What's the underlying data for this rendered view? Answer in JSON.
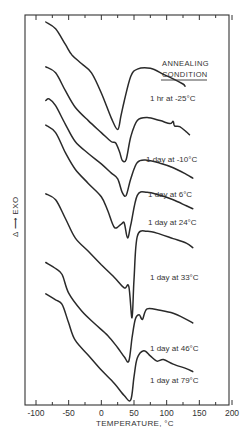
{
  "chart_data": {
    "type": "line",
    "title": "",
    "xlabel": "TEMPERATURE, °C",
    "ylabel": "Δ ⟶ EXO",
    "xlim": [
      -110,
      200
    ],
    "xticks": [
      -100,
      -50,
      0,
      50,
      100,
      150,
      200
    ],
    "xtick_labels": [
      "-100",
      "-50",
      "0",
      "50",
      "100",
      "150",
      "200"
    ],
    "grid": false,
    "legend_title": [
      "ANNEALING",
      "CONDITION"
    ],
    "legend_position": "right, beside each curve",
    "y_units": "arbitrary (curves vertically offset)",
    "series": [
      {
        "name": "1 hr at -25°C",
        "label": "1 hr at -25°C",
        "approx_min_temp": 25,
        "points": [
          [
            -85,
            0.0
          ],
          [
            -70,
            -0.9
          ],
          [
            -55,
            -3.0
          ],
          [
            -45,
            -4.4
          ],
          [
            -30,
            -5.6
          ],
          [
            -15,
            -6.8
          ],
          [
            0,
            -9.5
          ],
          [
            15,
            -12.8
          ],
          [
            25,
            -14.4
          ],
          [
            30,
            -12.6
          ],
          [
            35,
            -10.6
          ],
          [
            45,
            -7.3
          ],
          [
            55,
            -6.3
          ],
          [
            75,
            -6.2
          ],
          [
            95,
            -7.0
          ],
          [
            110,
            -7.6
          ],
          [
            125,
            -8.3
          ],
          [
            128,
            -8.6
          ]
        ]
      },
      {
        "name": "1 day at -10°C",
        "label": "1 day at -10°C",
        "approx_min_temp": 35,
        "points": [
          [
            -85,
            -6.0
          ],
          [
            -70,
            -6.8
          ],
          [
            -55,
            -9.2
          ],
          [
            -40,
            -11.4
          ],
          [
            -20,
            -13.2
          ],
          [
            0,
            -14.8
          ],
          [
            15,
            -16.0
          ],
          [
            22,
            -16.2
          ],
          [
            28,
            -17.4
          ],
          [
            32,
            -18.5
          ],
          [
            38,
            -18.4
          ],
          [
            45,
            -15.4
          ],
          [
            55,
            -13.2
          ],
          [
            70,
            -12.8
          ],
          [
            90,
            -13.2
          ],
          [
            105,
            -13.6
          ],
          [
            110,
            -13.3
          ],
          [
            112,
            -13.9
          ],
          [
            120,
            -14.0
          ],
          [
            130,
            -14.7
          ],
          [
            135,
            -15.1
          ]
        ]
      },
      {
        "name": "1 day at 6°C",
        "label": "1 day at 6°C",
        "approx_min_temp": 38,
        "points": [
          [
            -85,
            -10.5
          ],
          [
            -80,
            -10.3
          ],
          [
            -70,
            -11.2
          ],
          [
            -55,
            -13.7
          ],
          [
            -40,
            -16.0
          ],
          [
            -20,
            -17.6
          ],
          [
            0,
            -19.0
          ],
          [
            15,
            -20.2
          ],
          [
            25,
            -21.0
          ],
          [
            32,
            -22.8
          ],
          [
            38,
            -23.2
          ],
          [
            45,
            -21.0
          ],
          [
            55,
            -18.8
          ],
          [
            70,
            -18.5
          ],
          [
            90,
            -18.9
          ],
          [
            110,
            -19.5
          ],
          [
            130,
            -20.4
          ],
          [
            140,
            -20.9
          ]
        ]
      },
      {
        "name": "1 day at 24°C",
        "label": "1 day at 24°C",
        "approx_min_temp": 25,
        "points": [
          [
            -85,
            -13.8
          ],
          [
            -70,
            -14.8
          ],
          [
            -55,
            -17.5
          ],
          [
            -40,
            -19.7
          ],
          [
            -20,
            -21.6
          ],
          [
            0,
            -23.4
          ],
          [
            10,
            -25.3
          ],
          [
            20,
            -27.5
          ],
          [
            30,
            -27.1
          ],
          [
            35,
            -26.9
          ],
          [
            40,
            -28.9
          ],
          [
            45,
            -27.2
          ],
          [
            55,
            -23.2
          ],
          [
            70,
            -22.8
          ],
          [
            90,
            -23.2
          ],
          [
            110,
            -23.8
          ],
          [
            130,
            -24.6
          ],
          [
            140,
            -25.0
          ]
        ]
      },
      {
        "name": "1 day at 33°C",
        "label": "1 day at 33°C",
        "approx_min_temp": 47,
        "points": [
          [
            -85,
            -23.0
          ],
          [
            -70,
            -23.8
          ],
          [
            -55,
            -26.3
          ],
          [
            -40,
            -28.9
          ],
          [
            -20,
            -30.7
          ],
          [
            0,
            -32.5
          ],
          [
            20,
            -34.2
          ],
          [
            35,
            -35.6
          ],
          [
            42,
            -35.4
          ],
          [
            47,
            -39.6
          ],
          [
            50,
            -34.5
          ],
          [
            55,
            -28.7
          ],
          [
            70,
            -28.0
          ],
          [
            90,
            -28.4
          ],
          [
            110,
            -29.0
          ],
          [
            130,
            -29.6
          ],
          [
            140,
            -30.2
          ]
        ]
      },
      {
        "name": "1 day at 46°C",
        "label": "1 day at 46°C",
        "approx_min_temp": 42,
        "points": [
          [
            -85,
            -32.2
          ],
          [
            -70,
            -33.0
          ],
          [
            -60,
            -33.8
          ],
          [
            -50,
            -36.3
          ],
          [
            -30,
            -38.7
          ],
          [
            -10,
            -40.4
          ],
          [
            10,
            -42.0
          ],
          [
            25,
            -43.6
          ],
          [
            35,
            -44.8
          ],
          [
            42,
            -45.4
          ],
          [
            47,
            -42.3
          ],
          [
            52,
            -39.8
          ],
          [
            58,
            -39.2
          ],
          [
            63,
            -39.8
          ],
          [
            70,
            -38.4
          ],
          [
            90,
            -38.6
          ],
          [
            110,
            -39.0
          ],
          [
            130,
            -39.8
          ],
          [
            140,
            -40.3
          ]
        ]
      },
      {
        "name": "1 day at 79°C",
        "label": "1 day at 79°C",
        "approx_min_temp": 45,
        "points": [
          [
            -85,
            -36.4
          ],
          [
            -70,
            -37.2
          ],
          [
            -60,
            -37.8
          ],
          [
            -50,
            -40.3
          ],
          [
            -40,
            -42.6
          ],
          [
            -20,
            -44.6
          ],
          [
            0,
            -46.6
          ],
          [
            20,
            -48.4
          ],
          [
            35,
            -50.0
          ],
          [
            45,
            -50.6
          ],
          [
            50,
            -47.5
          ],
          [
            55,
            -45.0
          ],
          [
            65,
            -44.0
          ],
          [
            75,
            -44.7
          ],
          [
            85,
            -45.4
          ],
          [
            95,
            -45.2
          ],
          [
            110,
            -45.8
          ],
          [
            130,
            -46.4
          ],
          [
            140,
            -46.8
          ]
        ]
      }
    ]
  },
  "labels": {
    "legend_title_1": "ANNEALING",
    "legend_title_2": "CONDITION",
    "xlabel": "TEMPERATURE, °C",
    "ylabel": "Δ ⟶ EXO"
  }
}
